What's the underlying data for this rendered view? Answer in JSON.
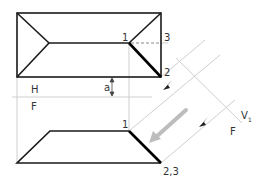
{
  "diagram": {
    "labels": {
      "point1_top": "1",
      "point3_top": "3",
      "point2_top": "2",
      "point1_front": "1",
      "point23_front": "2,3",
      "fold_H": "H",
      "fold_F": "F",
      "dimension_a": "a",
      "aux_fold_V": "V",
      "aux_fold_V_sub": "1",
      "aux_fold_F": "F"
    },
    "colors": {
      "outline": "#1a1a1a",
      "construction": "#c8c8c8",
      "arrow": "#b0b0b0",
      "text": "#333333"
    }
  }
}
